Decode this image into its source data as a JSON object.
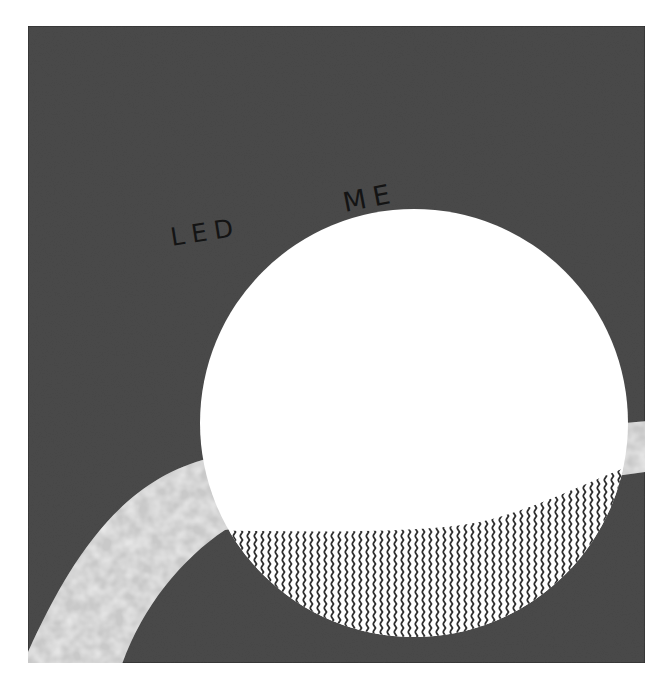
{
  "scene": {
    "background_color": "#ffffff",
    "frame": {
      "x": 28,
      "y": 26,
      "width": 617,
      "height": 637,
      "fill": "#4a4a4a",
      "border": "#2a2a2a"
    },
    "circle": {
      "cx": 414,
      "cy": 423,
      "r": 214,
      "fill": "#ffffff"
    },
    "wave_fill": {
      "stroke": "#2e2e2e",
      "background": "#ffffff"
    },
    "band": {
      "fill": "#c9c9c9",
      "highlight": "#dedede"
    }
  },
  "labels": {
    "left": "LED",
    "right": "ME"
  }
}
